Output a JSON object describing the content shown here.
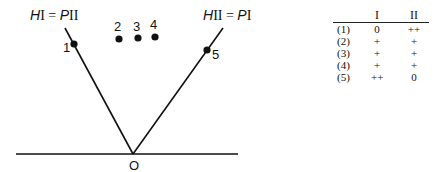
{
  "diagram": {
    "left_line_label": {
      "prefix": "H",
      "sub1": "I",
      "eq": " = ",
      "prefix2": "P",
      "sub2": "II"
    },
    "right_line_label": {
      "prefix": "H",
      "sub1": "II",
      "eq": " = ",
      "prefix2": "P",
      "sub2": "I"
    },
    "origin_label": "O",
    "points": [
      {
        "label": "1",
        "x": 74,
        "y": 44
      },
      {
        "label": "2",
        "x": 119,
        "y": 39
      },
      {
        "label": "3",
        "x": 138,
        "y": 38
      },
      {
        "label": "4",
        "x": 155,
        "y": 37
      },
      {
        "label": "5",
        "x": 207,
        "y": 50
      }
    ],
    "colors": {
      "ink": "#111111",
      "background": "#ffffff"
    }
  },
  "table": {
    "headers": [
      "",
      "I",
      "II"
    ],
    "rows": [
      {
        "label": "(1)",
        "I": "0",
        "II": "++"
      },
      {
        "label": "(2)",
        "I": "+",
        "II": "+"
      },
      {
        "label": "(3)",
        "I": "+",
        "II": "+"
      },
      {
        "label": "(4)",
        "I": "+",
        "II": "+"
      },
      {
        "label": "(5)",
        "I": "++",
        "II": "0"
      }
    ]
  }
}
